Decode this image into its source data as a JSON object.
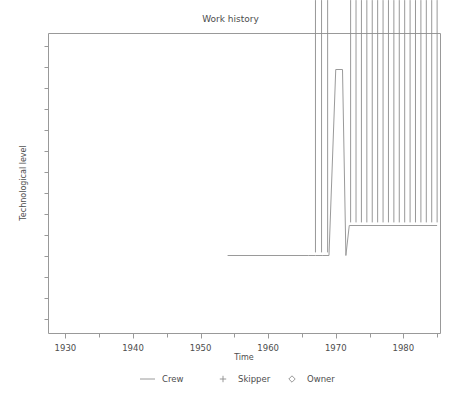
{
  "chart_data": {
    "type": "line",
    "title": "Work history",
    "xlabel": "Time",
    "ylabel": "Technological level",
    "xlim": [
      1927.5,
      1985.5
    ],
    "ylim": [
      0,
      10
    ],
    "grid": false,
    "x_ticks_major": [
      1930,
      1940,
      1950,
      1960,
      1970,
      1980
    ],
    "x_tick_labels": [
      "1930",
      "1940",
      "1950",
      "1960",
      "1970",
      "1980"
    ],
    "x_ticks_minor": [
      1935,
      1945,
      1955,
      1965,
      1975,
      1985
    ],
    "y_ticks": [
      0.5,
      1.2,
      1.9,
      2.6,
      3.3,
      4.0,
      4.7,
      5.4,
      6.1,
      6.8,
      7.5,
      8.2,
      8.9,
      9.6
    ],
    "y_tick_labels": [],
    "legend_position": "bottom",
    "series": [
      {
        "name": "Crew",
        "marker": "line",
        "type": "line",
        "x": [
          1954.0,
          1966.0,
          1967.0,
          1968.0,
          1969.0,
          1970.0,
          1971.0,
          1971.5,
          1972.0,
          1985.0
        ],
        "y": [
          2.6,
          2.6,
          2.6,
          2.6,
          2.6,
          8.8,
          8.8,
          2.6,
          3.6,
          3.6
        ]
      },
      {
        "name": "Skipper",
        "marker": "+",
        "type": "scatter",
        "x": [],
        "y": []
      },
      {
        "name": "Owner",
        "marker": "diamond",
        "type": "scatter",
        "x": [
          1967.0,
          1967.9,
          1968.8,
          1972.2,
          1973.0,
          1973.8,
          1974.6,
          1975.4,
          1976.2,
          1977.0,
          1977.8,
          1978.6,
          1979.4,
          1980.2,
          1981.0,
          1981.8,
          1982.6,
          1983.4,
          1984.2,
          1985.0
        ],
        "y": [
          2.6,
          2.6,
          2.6,
          3.6,
          3.6,
          3.6,
          3.6,
          3.6,
          3.6,
          3.6,
          3.6,
          3.6,
          3.6,
          3.6,
          3.6,
          3.6,
          3.6,
          3.6,
          3.6,
          3.6
        ]
      }
    ]
  },
  "legend": {
    "items": [
      {
        "label": "Crew",
        "marker": "line"
      },
      {
        "label": "Skipper",
        "marker": "plus"
      },
      {
        "label": "Owner",
        "marker": "diamond"
      }
    ]
  },
  "colors": {
    "axis": "#999999",
    "series": "#9a9a9a",
    "marker": "#8c8c8c",
    "text": "#4d4d4d",
    "background": "#ffffff"
  }
}
